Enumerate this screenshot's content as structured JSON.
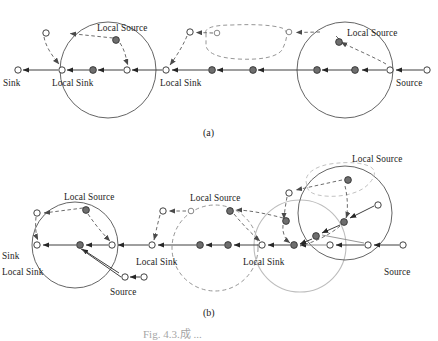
{
  "figure": {
    "panel_a_label": "(a)",
    "panel_b_label": "(b)",
    "caption_partial": "Fig. 4.3.成 ..."
  },
  "colors": {
    "ink": "#1c1c1c",
    "line": "#3f3f3f",
    "node_fill_dark": "#6e6e6e",
    "node_stroke": "#2b2b2b",
    "node_fill_open": "#ffffff",
    "dashed": "#5b5b5b",
    "circle_gray_light": "#b9b9b9",
    "circle_dashed": "#8a8a8a"
  },
  "legend_terms": {
    "sink": "Sink",
    "source": "Source",
    "local_sink": "Local Sink",
    "local_source": "Local Source"
  },
  "panel_a": {
    "labels": [
      {
        "text": "Sink",
        "x": 3,
        "y": 84
      },
      {
        "text": "Local Sink",
        "x": 52,
        "y": 84
      },
      {
        "text": "Local Sink",
        "x": 160,
        "y": 84
      },
      {
        "text": "Local Source",
        "x": 97,
        "y": 27
      },
      {
        "text": "Local Source",
        "x": 350,
        "y": 32
      },
      {
        "text": "Source",
        "x": 397,
        "y": 84
      }
    ],
    "open_nodes": [
      {
        "x": 18,
        "y": 70
      },
      {
        "x": 62,
        "y": 70
      },
      {
        "x": 127,
        "y": 70
      },
      {
        "x": 166,
        "y": 70
      },
      {
        "x": 390,
        "y": 70
      },
      {
        "x": 427,
        "y": 70
      },
      {
        "x": 46,
        "y": 33
      },
      {
        "x": 190,
        "y": 32
      },
      {
        "x": 217,
        "y": 34
      },
      {
        "x": 289,
        "y": 33
      }
    ],
    "filled_nodes": [
      {
        "x": 93,
        "y": 70
      },
      {
        "x": 212,
        "y": 70
      },
      {
        "x": 253,
        "y": 70
      },
      {
        "x": 317,
        "y": 70
      },
      {
        "x": 352,
        "y": 70
      },
      {
        "x": 357,
        "y": 70
      },
      {
        "x": 116,
        "y": 40
      },
      {
        "x": 339,
        "y": 42
      }
    ],
    "regions": [
      {
        "type": "circle",
        "cx": 108,
        "cy": 70,
        "r": 48,
        "style": "solid"
      },
      {
        "type": "circle",
        "cx": 345,
        "cy": 70,
        "r": 48,
        "style": "solid"
      },
      {
        "type": "blob",
        "style": "dashed"
      }
    ]
  },
  "panel_b": {
    "labels": [
      {
        "text": "Sink",
        "x": 3,
        "y": 256
      },
      {
        "text": "Local Sink",
        "x": 3,
        "y": 272
      },
      {
        "text": "Local Sink",
        "x": 138,
        "y": 264
      },
      {
        "text": "Local Sink",
        "x": 245,
        "y": 264
      },
      {
        "text": "Local Source",
        "x": 67,
        "y": 197
      },
      {
        "text": "Local Source",
        "x": 193,
        "y": 198
      },
      {
        "text": "Local Source",
        "x": 355,
        "y": 160
      },
      {
        "text": "Source",
        "x": 112,
        "y": 292
      },
      {
        "text": "Source",
        "x": 386,
        "y": 272
      }
    ],
    "open_nodes": [
      {
        "x": 37,
        "y": 245
      },
      {
        "x": 112,
        "y": 245
      },
      {
        "x": 152,
        "y": 245
      },
      {
        "x": 262,
        "y": 245
      },
      {
        "x": 330,
        "y": 245
      },
      {
        "x": 368,
        "y": 245
      },
      {
        "x": 403,
        "y": 245
      },
      {
        "x": 37,
        "y": 213
      },
      {
        "x": 163,
        "y": 211
      },
      {
        "x": 191,
        "y": 211
      },
      {
        "x": 289,
        "y": 193
      },
      {
        "x": 378,
        "y": 205
      },
      {
        "x": 125,
        "y": 277
      }
    ],
    "filled_nodes": [
      {
        "x": 80,
        "y": 245
      },
      {
        "x": 200,
        "y": 245
      },
      {
        "x": 228,
        "y": 245
      },
      {
        "x": 294,
        "y": 245
      },
      {
        "x": 86,
        "y": 210
      },
      {
        "x": 230,
        "y": 211
      },
      {
        "x": 348,
        "y": 180
      },
      {
        "x": 344,
        "y": 222
      },
      {
        "x": 316,
        "y": 236
      },
      {
        "x": 286,
        "y": 221
      }
    ],
    "regions": [
      {
        "type": "circle",
        "cx": 75,
        "cy": 245,
        "r": 43,
        "style": "solid"
      },
      {
        "type": "circle",
        "cx": 215,
        "cy": 248,
        "r": 43,
        "style": "dashed"
      },
      {
        "type": "circle",
        "cx": 300,
        "cy": 246,
        "r": 46,
        "style": "solid-light"
      },
      {
        "type": "circle",
        "cx": 345,
        "cy": 213,
        "r": 47,
        "style": "solid"
      },
      {
        "type": "blob",
        "style": "dashed-light"
      }
    ]
  }
}
